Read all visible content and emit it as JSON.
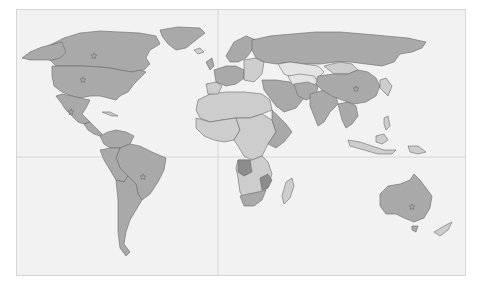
{
  "map": {
    "type": "world-choropleth",
    "projection": "equirectangular",
    "frame": {
      "x": 16,
      "y": 9,
      "width": 450,
      "height": 267
    },
    "colors": {
      "ocean": "#f2f2f2",
      "frame_border": "#d6d6d6",
      "graticule": "#cfcfcf",
      "land_medium": "#a9a9a9",
      "land_light": "#cdcdcd",
      "land_very_light": "#e4e4e4",
      "land_dark": "#8c8c8c",
      "border": "#6a6a6a",
      "star": "#7a7a7a"
    },
    "graticule": {
      "equator_y": 157,
      "prime_meridian_x": 218
    },
    "regions": [
      {
        "name": "greenland",
        "shade": "land_medium",
        "points": "160,30 178,27 200,28 205,33 196,40 186,48 176,50 168,44 162,36"
      },
      {
        "name": "canada",
        "shade": "land_medium",
        "points": "24,57 40,50 52,44 64,38 80,33 100,31 120,32 140,33 156,36 160,44 150,50 146,58 150,64 144,70 132,72 120,70 110,68 100,67 82,66 66,66 56,66 50,60 38,58"
      },
      {
        "name": "alaska",
        "shade": "land_medium",
        "points": "22,58 30,52 42,47 54,44 62,42 66,52 60,58 52,60 40,60 30,60"
      },
      {
        "name": "usa",
        "shade": "land_medium",
        "points": "52,66 66,66 82,66 100,67 110,68 120,70 132,72 140,70 146,72 140,78 134,84 128,92 120,96 116,100 108,98 100,96 90,96 80,98 72,96 62,92 54,86 52,76"
      },
      {
        "name": "mexico",
        "shade": "land_medium",
        "points": "56,96 62,94 72,96 80,98 90,100 86,108 82,114 86,118 90,122 84,124 78,122 72,116 66,110 62,104"
      },
      {
        "name": "central-america",
        "shade": "land_medium",
        "points": "84,124 90,122 94,126 98,130 102,134 100,136 94,134 88,130"
      },
      {
        "name": "cuba",
        "shade": "land_light",
        "points": "102,112 110,112 118,116 112,116"
      },
      {
        "name": "colombia-venezuela",
        "shade": "land_medium",
        "points": "100,136 108,132 116,130 126,132 134,136 130,144 120,148 110,148 104,144"
      },
      {
        "name": "brazil",
        "shade": "land_medium",
        "points": "120,148 130,144 140,146 152,152 166,158 164,170 158,182 150,194 142,200 138,194 136,184 128,176 120,168 116,158"
      },
      {
        "name": "peru-bolivia",
        "shade": "land_medium",
        "points": "100,150 110,148 120,148 116,158 120,168 128,176 124,182 116,180 110,170 104,160"
      },
      {
        "name": "argentina-chile",
        "shade": "land_medium",
        "points": "116,180 124,182 128,176 136,184 138,194 142,200 136,210 130,220 126,232 124,244 130,252 126,256 120,248 118,232 118,216 118,200"
      },
      {
        "name": "north-africa",
        "shade": "land_light",
        "points": "198,100 210,94 226,92 244,92 262,94 270,100 272,110 262,114 250,118 236,118 222,120 210,122 200,118 196,110"
      },
      {
        "name": "west-africa",
        "shade": "land_light",
        "points": "196,118 210,122 222,120 236,118 240,130 234,140 224,142 214,140 204,136 196,128"
      },
      {
        "name": "central-africa",
        "shade": "land_light",
        "points": "236,118 250,118 262,114 272,120 276,132 268,144 262,156 252,160 244,156 238,146 234,140 240,130"
      },
      {
        "name": "east-africa",
        "shade": "land_medium",
        "points": "272,110 278,116 286,124 292,132 284,142 276,148 268,144 276,132 272,120"
      },
      {
        "name": "southern-africa",
        "shade": "land_light",
        "points": "238,160 252,160 262,156 268,162 272,174 268,186 262,196 254,202 246,202 240,192 238,178 236,168"
      },
      {
        "name": "angola",
        "shade": "land_dark",
        "points": "238,160 250,160 252,172 244,176 238,172"
      },
      {
        "name": "zimbabwe-mozambique",
        "shade": "land_dark",
        "points": "260,178 268,174 272,180 268,188 262,190"
      },
      {
        "name": "south-africa",
        "shade": "land_medium",
        "points": "240,196 248,194 258,192 266,190 262,200 254,206 244,206"
      },
      {
        "name": "madagascar",
        "shade": "land_light",
        "points": "286,182 292,178 294,186 290,198 284,204 282,196"
      },
      {
        "name": "iberia",
        "shade": "land_light",
        "points": "206,84 216,82 222,86 218,94 208,94"
      },
      {
        "name": "western-europe",
        "shade": "land_medium",
        "points": "214,70 226,66 236,66 244,70 244,78 236,84 226,86 216,82"
      },
      {
        "name": "uk",
        "shade": "land_medium",
        "points": "206,62 212,58 214,66 210,70"
      },
      {
        "name": "scandinavia",
        "shade": "land_medium",
        "points": "226,56 234,42 246,36 256,40 252,50 246,58 238,62 230,62"
      },
      {
        "name": "eastern-europe",
        "shade": "land_light",
        "points": "244,60 256,58 264,62 262,74 254,82 244,80 244,70"
      },
      {
        "name": "russia",
        "shade": "land_medium",
        "points": "252,40 270,36 292,34 316,32 340,32 364,34 386,36 408,38 426,42 422,48 412,52 400,54 394,62 382,66 366,64 350,62 336,62 320,64 304,64 290,62 276,64 264,62 256,58 252,50"
      },
      {
        "name": "kazakhstan",
        "shade": "land_very_light",
        "points": "278,64 290,62 304,64 318,66 324,72 318,78 306,80 294,78 284,74"
      },
      {
        "name": "mongolia",
        "shade": "land_light",
        "points": "324,66 340,62 352,64 358,70 348,74 334,74"
      },
      {
        "name": "middle-east",
        "shade": "land_medium",
        "points": "262,80 276,80 290,82 300,88 304,98 296,108 284,112 276,106 270,98 264,90"
      },
      {
        "name": "central-asia",
        "shade": "land_very_light",
        "points": "288,76 300,74 314,76 318,82 310,88 300,88 292,84"
      },
      {
        "name": "iran-afghanistan",
        "shade": "land_medium",
        "points": "294,84 308,82 318,86 316,96 306,100 298,96"
      },
      {
        "name": "india",
        "shade": "land_medium",
        "points": "310,94 324,90 336,96 338,104 330,112 324,122 318,126 314,116 310,106"
      },
      {
        "name": "china",
        "shade": "land_medium",
        "points": "318,76 334,74 348,74 358,70 368,72 376,78 380,86 376,96 366,102 354,104 342,100 332,96 322,90 316,84"
      },
      {
        "name": "southeast-asia",
        "shade": "land_medium",
        "points": "338,104 348,102 356,106 358,116 352,124 346,128 342,120 340,112"
      },
      {
        "name": "korea-japan",
        "shade": "land_light",
        "points": "380,80 386,78 392,86 388,96 384,92 380,88"
      },
      {
        "name": "indonesia",
        "shade": "land_light",
        "points": "348,140 360,142 372,146 384,150 396,150 392,154 378,154 364,150 350,146"
      },
      {
        "name": "borneo",
        "shade": "land_light",
        "points": "376,136 384,134 388,140 382,144 376,142"
      },
      {
        "name": "new-guinea",
        "shade": "land_light",
        "points": "408,146 418,146 426,152 418,154 410,152"
      },
      {
        "name": "philippines",
        "shade": "land_light",
        "points": "384,118 388,116 390,126 386,130 384,124"
      },
      {
        "name": "australia",
        "shade": "land_medium",
        "points": "380,194 388,186 400,184 410,180 414,174 420,180 426,188 432,196 430,208 424,218 414,222 404,218 396,214 386,214 380,206"
      },
      {
        "name": "tasmania",
        "shade": "land_medium",
        "points": "412,226 418,226 416,232 412,230"
      },
      {
        "name": "new-zealand",
        "shade": "land_light",
        "points": "434,232 444,226 452,222 448,230 440,236"
      },
      {
        "name": "iceland",
        "shade": "land_light",
        "points": "194,50 200,48 204,52 198,54"
      }
    ],
    "capital_stars": [
      {
        "name": "canada-star",
        "x": 94,
        "y": 56
      },
      {
        "name": "usa-star",
        "x": 83,
        "y": 80
      },
      {
        "name": "mexico-star",
        "x": 71,
        "y": 112
      },
      {
        "name": "brazil-star",
        "x": 143,
        "y": 177
      },
      {
        "name": "china-star",
        "x": 356,
        "y": 89
      },
      {
        "name": "australia-star",
        "x": 412,
        "y": 207
      }
    ]
  }
}
